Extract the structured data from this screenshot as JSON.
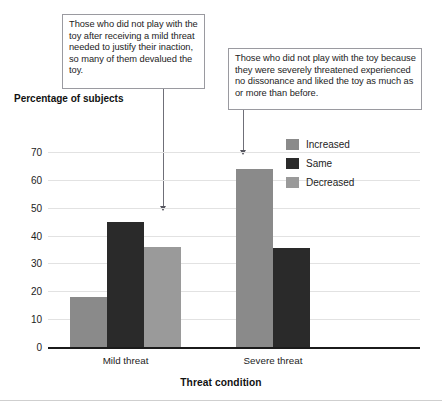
{
  "figure": {
    "y_axis_title": "Percentage of subjects",
    "x_axis_title": "Threat condition"
  },
  "annotations": [
    {
      "id": "callout-left",
      "text": "Those who did not play with the toy after receiving a mild threat needed to justify their inaction, so many of them devalued the toy.",
      "points_to": "Mild threat / Decreased"
    },
    {
      "id": "callout-right",
      "text": "Those who did not play with the toy because they were severely threatened experienced no dissonance and liked the toy as much as or more than before.",
      "points_to": "Severe threat / Increased"
    }
  ],
  "legend": {
    "position": "top-right-inside",
    "entries": [
      {
        "label": "Increased",
        "color": "#8a8a8a"
      },
      {
        "label": "Same",
        "color": "#2a2a2a"
      },
      {
        "label": "Decreased",
        "color": "#9a9a9a"
      }
    ]
  },
  "chart_data": {
    "type": "bar",
    "title": "",
    "subtitle": "",
    "xlabel": "Threat condition",
    "ylabel": "Percentage of subjects",
    "categories": [
      "Mild threat",
      "Severe threat"
    ],
    "series": [
      {
        "name": "Increased",
        "color": "#8a8a8a",
        "values": [
          18,
          64
        ]
      },
      {
        "name": "Same",
        "color": "#2a2a2a",
        "values": [
          45,
          35.5
        ]
      },
      {
        "name": "Decreased",
        "color": "#9a9a9a",
        "values": [
          36,
          null
        ]
      }
    ],
    "ylim": [
      0,
      70
    ],
    "yticks": [
      0,
      10,
      20,
      30,
      40,
      50,
      60,
      70
    ],
    "ytick_labels": [
      "0",
      "10",
      "20",
      "30",
      "40",
      "50",
      "60",
      "70"
    ],
    "grid": "horizontal"
  }
}
